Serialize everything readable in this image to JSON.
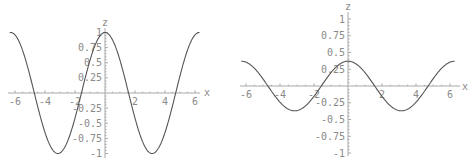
{
  "chart_data": [
    {
      "type": "line",
      "title": "",
      "xlabel": "x",
      "ylabel": "z",
      "function": "z = cos(x)",
      "xlim": [
        -6.3,
        6.3
      ],
      "ylim": [
        -1,
        1
      ],
      "x_ticks": [
        -6,
        -4,
        -2,
        2,
        4,
        6
      ],
      "x_tick_labels": [
        "-6",
        "-4",
        "-2",
        "2",
        "4",
        "6"
      ],
      "y_ticks": [
        -1,
        -0.75,
        -0.5,
        -0.25,
        0.25,
        0.5,
        0.75,
        1
      ],
      "y_tick_labels": [
        "-1",
        "-0.75",
        "-0.5",
        "-0.25",
        "0.25",
        "0.5",
        "0.75",
        "1"
      ],
      "amplitude": 1,
      "x": [
        -6.28,
        -4.71,
        -3.14,
        -1.57,
        0,
        1.57,
        3.14,
        4.71,
        6.28
      ],
      "values": [
        1,
        0,
        -1,
        0,
        1,
        0,
        -1,
        0,
        1
      ],
      "grid": false,
      "legend": null
    },
    {
      "type": "line",
      "title": "",
      "xlabel": "x",
      "ylabel": "z",
      "function": "z ≈ 0.37·cos(x)",
      "xlim": [
        -6.3,
        6.3
      ],
      "ylim": [
        -1,
        1
      ],
      "x_ticks": [
        -6,
        -4,
        -2,
        2,
        4,
        6
      ],
      "x_tick_labels": [
        "-6",
        "-4",
        "-2",
        "2",
        "4",
        "6"
      ],
      "y_ticks": [
        -1,
        -0.75,
        -0.5,
        -0.25,
        0.25,
        0.5,
        0.75,
        1
      ],
      "y_tick_labels": [
        "-1",
        "-0.75",
        "-0.5",
        "-0.25",
        "0.25",
        "0.5",
        "0.75",
        "1"
      ],
      "amplitude": 0.37,
      "x": [
        -6.28,
        -4.71,
        -3.14,
        -1.57,
        0,
        1.57,
        3.14,
        4.71,
        6.28
      ],
      "values": [
        0.37,
        0,
        -0.37,
        0,
        0.37,
        0,
        -0.37,
        0,
        0.37
      ],
      "grid": false,
      "legend": null
    }
  ],
  "plots": [
    {
      "xlabel": "x",
      "ylabel": "z",
      "x_tick_labels": [
        "-6",
        "-4",
        "-2",
        "2",
        "4",
        "6"
      ],
      "y_tick_labels": [
        "1",
        "0.75",
        "0.5",
        "0.25",
        "-0.25",
        "-0.5",
        "-0.75",
        "-1"
      ]
    },
    {
      "xlabel": "x",
      "ylabel": "z",
      "x_tick_labels": [
        "-6",
        "-4",
        "-2",
        "2",
        "4",
        "6"
      ],
      "y_tick_labels": [
        "1",
        "0.75",
        "0.5",
        "0.25",
        "-0.25",
        "-0.5",
        "-0.75",
        "-1"
      ]
    }
  ],
  "colors": {
    "curve": "#555555",
    "axis": "#a8a8a8",
    "text": "#8a8a8a"
  }
}
